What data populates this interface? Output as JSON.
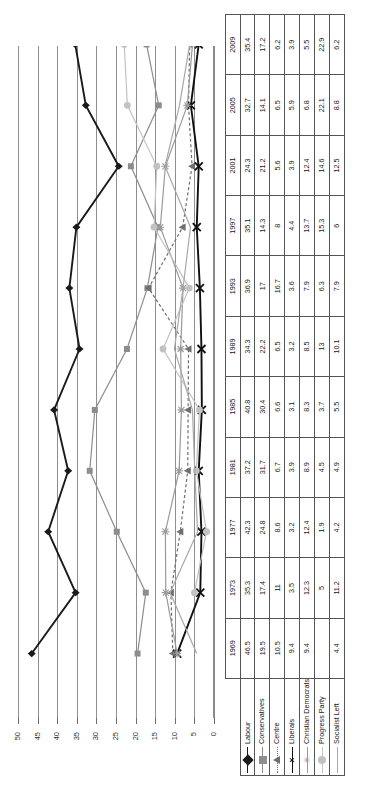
{
  "chart_data": {
    "type": "line",
    "title": "",
    "xlabel": "",
    "ylabel": "",
    "orientation": "rotated-90-ccw",
    "grid": true,
    "legend_position": "table-row-labels",
    "ylim": [
      0,
      50
    ],
    "yticks": [
      "50",
      "45",
      "40",
      "35",
      "30",
      "25",
      "20",
      "15",
      "10",
      "5",
      "0"
    ],
    "categories": [
      "1969",
      "1973",
      "1977",
      "1981",
      "1985",
      "1989",
      "1993",
      "1997",
      "2001",
      "2005",
      "2009"
    ],
    "series": [
      {
        "name": "Labour",
        "color": "#1a1a1a",
        "marker": "diamond",
        "dash": "solid",
        "width": 1.9,
        "values": [
          46.5,
          35.3,
          42.3,
          37.2,
          40.8,
          34.3,
          36.9,
          35.1,
          24.3,
          32.7,
          35.4
        ]
      },
      {
        "name": "Conservatives",
        "color": "#8d8d8d",
        "marker": "square",
        "dash": "solid",
        "width": 1.2,
        "values": [
          19.5,
          17.4,
          24.8,
          31.7,
          30.4,
          22.2,
          17.0,
          14.3,
          21.2,
          14.1,
          17.2
        ]
      },
      {
        "name": "Centre",
        "color": "#6e6e6e",
        "marker": "triangle",
        "dash": "dotted",
        "width": 1.2,
        "values": [
          10.5,
          11.0,
          8.6,
          6.7,
          6.6,
          6.5,
          16.7,
          8.0,
          5.6,
          6.5,
          6.2
        ]
      },
      {
        "name": "Liberals",
        "color": "#101010",
        "marker": "cross",
        "dash": "solid",
        "width": 1.9,
        "values": [
          9.4,
          3.5,
          3.2,
          3.9,
          3.1,
          3.2,
          3.6,
          4.4,
          3.9,
          5.9,
          3.9
        ]
      },
      {
        "name": "Christian Democrats",
        "color": "#9a9a9a",
        "marker": "star",
        "dash": "solid",
        "width": 1.2,
        "values": [
          9.4,
          12.3,
          12.4,
          8.9,
          8.3,
          8.5,
          7.9,
          13.7,
          12.4,
          6.8,
          5.5
        ]
      },
      {
        "name": "Progress Party",
        "color": "#c2c2c2",
        "marker": "circle",
        "dash": "solid",
        "width": 1.2,
        "values": [
          null,
          5.0,
          1.9,
          4.5,
          3.7,
          13.0,
          6.3,
          15.3,
          14.6,
          22.1,
          22.9
        ]
      },
      {
        "name": "Socialist Left",
        "color": "#a8a8a8",
        "marker": "none",
        "dash": "solid",
        "width": 1.2,
        "values": [
          4.4,
          11.2,
          4.2,
          4.9,
          5.5,
          10.1,
          7.9,
          6.0,
          12.5,
          8.8,
          6.2
        ]
      }
    ]
  },
  "table": {
    "corner_label": "",
    "year_header": [
      "1969",
      "1973",
      "1977",
      "1981",
      "1985",
      "1989",
      "1993",
      "1997",
      "2001",
      "2005",
      "2009"
    ],
    "rows": [
      {
        "label": "Labour",
        "values": [
          "46.5",
          "35.3",
          "42.3",
          "37.2",
          "40.8",
          "34.3",
          "36.9",
          "35.1",
          "24.3",
          "32.7",
          "35.4"
        ]
      },
      {
        "label": "Conservatives",
        "values": [
          "19.5",
          "17.4",
          "24.8",
          "31.7",
          "30.4",
          "22.2",
          "17",
          "14.3",
          "21.2",
          "14.1",
          "17.2"
        ]
      },
      {
        "label": "Centre",
        "values": [
          "10.5",
          "11",
          "8.6",
          "6.7",
          "6.6",
          "6.5",
          "16.7",
          "8",
          "5.6",
          "6.5",
          "6.2"
        ]
      },
      {
        "label": "Liberals",
        "values": [
          "9.4",
          "3.5",
          "3.2",
          "3.9",
          "3.1",
          "3.2",
          "3.6",
          "4.4",
          "3.9",
          "5.9",
          "3.9"
        ]
      },
      {
        "label": "Christian Democrats",
        "values": [
          "9.4",
          "12.3",
          "12.4",
          "8.9",
          "8.3",
          "8.5",
          "7.9",
          "13.7",
          "12.4",
          "6.8",
          "5.5"
        ]
      },
      {
        "label": "Progress Party",
        "values": [
          "",
          "5",
          "1.9",
          "4.5",
          "3.7",
          "13",
          "6.3",
          "15.3",
          "14.6",
          "22.1",
          "22.9"
        ]
      },
      {
        "label": "Socialist Left",
        "values": [
          "4.4",
          "11.2",
          "4.2",
          "4.9",
          "5.5",
          "10.1",
          "7.9",
          "6",
          "12.5",
          "8.8",
          "6.2"
        ]
      }
    ]
  }
}
